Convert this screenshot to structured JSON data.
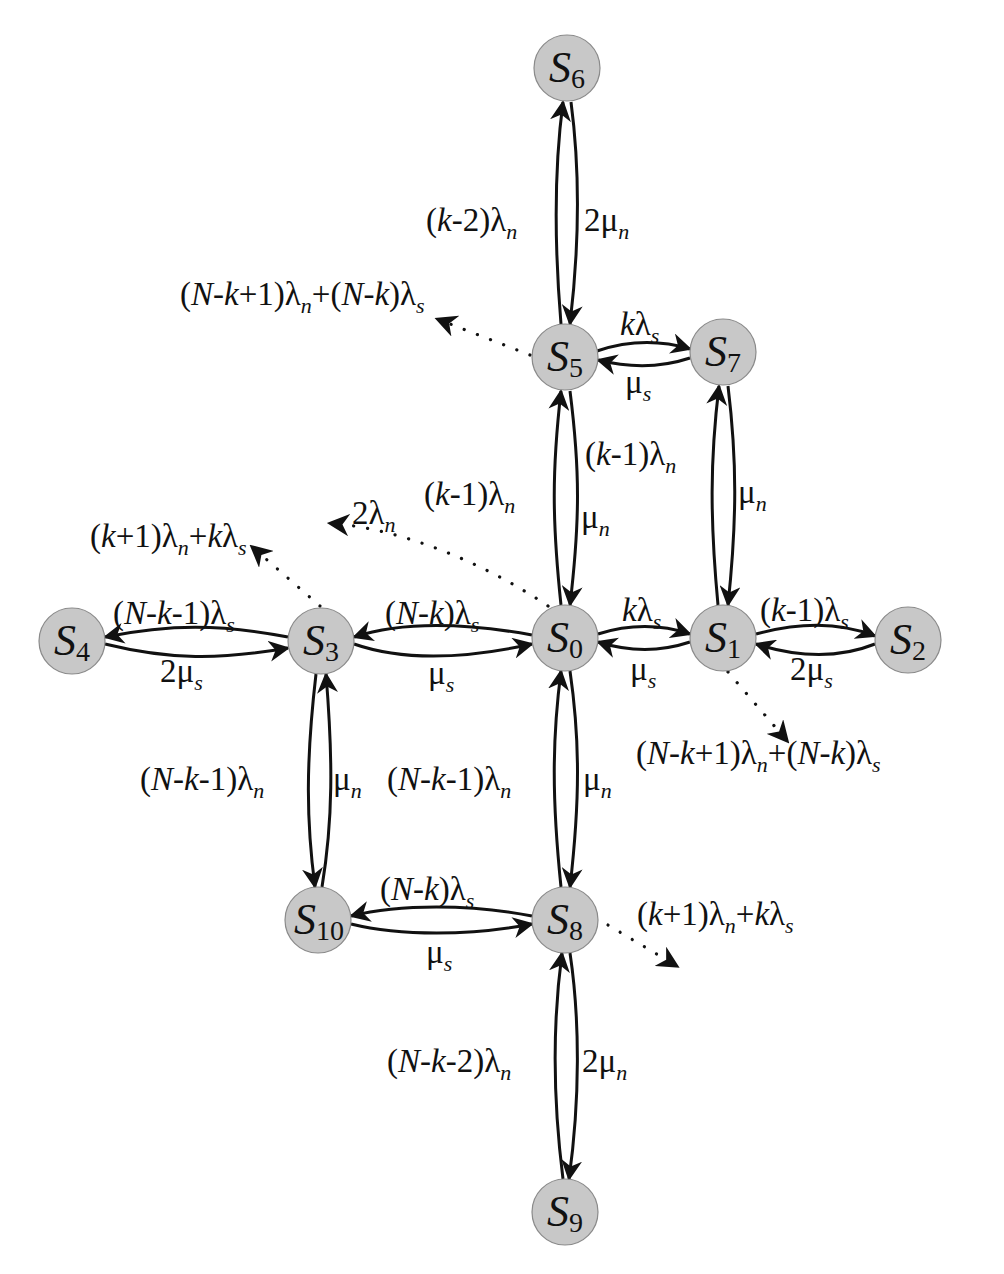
{
  "figure": {
    "type": "state-transition-diagram",
    "node_fill": "#c8c8c8",
    "node_stroke": "#8a8a8a",
    "edge_color": "#111111",
    "node_radius": 33
  },
  "nodes": [
    {
      "id": "S0",
      "letter": "S",
      "index": "0",
      "cx": 565,
      "cy": 638
    },
    {
      "id": "S1",
      "letter": "S",
      "index": "1",
      "cx": 723,
      "cy": 638
    },
    {
      "id": "S2",
      "letter": "S",
      "index": "2",
      "cx": 908,
      "cy": 640
    },
    {
      "id": "S3",
      "letter": "S",
      "index": "3",
      "cx": 321,
      "cy": 641
    },
    {
      "id": "S4",
      "letter": "S",
      "index": "4",
      "cx": 72,
      "cy": 641
    },
    {
      "id": "S5",
      "letter": "S",
      "index": "5",
      "cx": 565,
      "cy": 357
    },
    {
      "id": "S6",
      "letter": "S",
      "index": "6",
      "cx": 567,
      "cy": 68
    },
    {
      "id": "S7",
      "letter": "S",
      "index": "7",
      "cx": 723,
      "cy": 352
    },
    {
      "id": "S8",
      "letter": "S",
      "index": "8",
      "cx": 565,
      "cy": 920
    },
    {
      "id": "S9",
      "letter": "S",
      "index": "9",
      "cx": 565,
      "cy": 1212
    },
    {
      "id": "S10",
      "letter": "S",
      "index": "10",
      "cx": 318,
      "cy": 920
    }
  ],
  "edges": [
    {
      "from": "S5",
      "to": "S6",
      "forward_rate": "(k-2)λn",
      "backward_rate": "2μn",
      "orientation": "vertical"
    },
    {
      "from": "S5",
      "to": "S7",
      "forward_rate": "kλs",
      "backward_rate": "μs",
      "orientation": "horizontal"
    },
    {
      "from": "S0",
      "to": "S5",
      "forward_rate": "(k-1)λn",
      "backward_rate": "μn",
      "orientation": "vertical"
    },
    {
      "from": "S1",
      "to": "S7",
      "forward_rate": "(k-1)λn",
      "backward_rate": "μn",
      "orientation": "vertical"
    },
    {
      "from": "S3",
      "to": "S4",
      "forward_rate": "(N-k-1)λs",
      "backward_rate": "2μs",
      "orientation": "horizontal"
    },
    {
      "from": "S0",
      "to": "S3",
      "forward_rate": "(N-k)λs",
      "backward_rate": "μs",
      "orientation": "horizontal"
    },
    {
      "from": "S0",
      "to": "S1",
      "forward_rate": "kλs",
      "backward_rate": "μs",
      "orientation": "horizontal"
    },
    {
      "from": "S1",
      "to": "S2",
      "forward_rate": "(k-1)λs",
      "backward_rate": "2μs",
      "orientation": "horizontal"
    },
    {
      "from": "S3",
      "to": "S10",
      "forward_rate": "(N-k-1)λn",
      "backward_rate": "μn",
      "orientation": "vertical"
    },
    {
      "from": "S0",
      "to": "S8",
      "forward_rate": "(N-k-1)λn",
      "backward_rate": "μn",
      "orientation": "vertical"
    },
    {
      "from": "S8",
      "to": "S10",
      "forward_rate": "(N-k)λs",
      "backward_rate": "μs",
      "orientation": "horizontal"
    },
    {
      "from": "S8",
      "to": "S9",
      "forward_rate": "(N-k-2)λn",
      "backward_rate": "2μn",
      "orientation": "vertical"
    }
  ],
  "outgoing_dotted": [
    {
      "from": "S5",
      "rate": "(N-k+1)λn+(N-k)λs"
    },
    {
      "from": "S3",
      "rate": "(k+1)λn+kλs"
    },
    {
      "from": "S0",
      "rate": "2λn"
    },
    {
      "from": "S1",
      "rate": "(N-k+1)λn+(N-k)λs"
    },
    {
      "from": "S8",
      "rate": "(k+1)λn+kλs"
    }
  ],
  "labels": {
    "s6_s5_left": {
      "pre": "(",
      "k": "k",
      "mid": "-2)λ",
      "sub": "n"
    },
    "s6_s5_right": {
      "pre": "2μ",
      "sub": "n"
    },
    "s5_out": {
      "p1": "(",
      "N": "N",
      "m1": "-",
      "k1": "k",
      "m2": "+1)λ",
      "s1": "n",
      "m3": "+(",
      "N2": "N",
      "m4": "-",
      "k2": "k",
      "m5": ")λ",
      "s2": "s"
    },
    "s5_s7_top": {
      "k": "k",
      "l": "λ",
      "sub": "s"
    },
    "s5_s7_bottom": {
      "m": "μ",
      "sub": "s"
    },
    "s0_s5_left": {
      "pre": "(",
      "k": "k",
      "mid": "-1)λ",
      "sub": "n"
    },
    "s0_s5_right": {
      "m": "μ",
      "sub": "n"
    },
    "s1_s7_left": {
      "pre": "(",
      "k": "k",
      "mid": "-1)λ",
      "sub": "n"
    },
    "s1_s7_right": {
      "m": "μ",
      "sub": "n"
    },
    "s3_out": {
      "p1": "(",
      "k1": "k",
      "m1": "+1)λ",
      "s1": "n",
      "m2": "+",
      "k2": "k",
      "m3": "λ",
      "s2": "s"
    },
    "s0_out": {
      "pre": "2λ",
      "sub": "n"
    },
    "s3_s4_top": {
      "p1": "(",
      "N": "N",
      "m1": "-",
      "k": "k",
      "m2": "-1)λ",
      "sub": "s"
    },
    "s3_s4_bottom": {
      "pre": "2μ",
      "sub": "s"
    },
    "s0_s3_top": {
      "p1": "(",
      "N": "N",
      "m1": "-",
      "k": "k",
      "m2": ")λ",
      "sub": "s"
    },
    "s0_s3_bottom": {
      "m": "μ",
      "sub": "s"
    },
    "s0_s1_top": {
      "k": "k",
      "l": "λ",
      "sub": "s"
    },
    "s0_s1_bottom": {
      "m": "μ",
      "sub": "s"
    },
    "s1_s2_top": {
      "pre": "(",
      "k": "k",
      "mid": "-1)λ",
      "sub": "s"
    },
    "s1_s2_bottom": {
      "pre": "2μ",
      "sub": "s"
    },
    "s1_out": {
      "p1": "(",
      "N": "N",
      "m1": "-",
      "k1": "k",
      "m2": "+1)λ",
      "s1": "n",
      "m3": "+(",
      "N2": "N",
      "m4": "-",
      "k2": "k",
      "m5": ")λ",
      "s2": "s"
    },
    "s3_s10_left": {
      "p1": "(",
      "N": "N",
      "m1": "-",
      "k": "k",
      "m2": "-1)λ",
      "sub": "n"
    },
    "s3_s10_right": {
      "m": "μ",
      "sub": "n"
    },
    "s0_s8_left": {
      "p1": "(",
      "N": "N",
      "m1": "-",
      "k": "k",
      "m2": "-1)λ",
      "sub": "n"
    },
    "s0_s8_right": {
      "m": "μ",
      "sub": "n"
    },
    "s8_s10_top": {
      "p1": "(",
      "N": "N",
      "m1": "-",
      "k": "k",
      "m2": ")λ",
      "sub": "s"
    },
    "s8_s10_bottom": {
      "m": "μ",
      "sub": "s"
    },
    "s8_out": {
      "p1": "(",
      "k1": "k",
      "m1": "+1)λ",
      "s1": "n",
      "m2": "+",
      "k2": "k",
      "m3": "λ",
      "s2": "s"
    },
    "s8_s9_left": {
      "p1": "(",
      "N": "N",
      "m1": "-",
      "k": "k",
      "m2": "-2)λ",
      "sub": "n"
    },
    "s8_s9_right": {
      "pre": "2μ",
      "sub": "n"
    }
  }
}
